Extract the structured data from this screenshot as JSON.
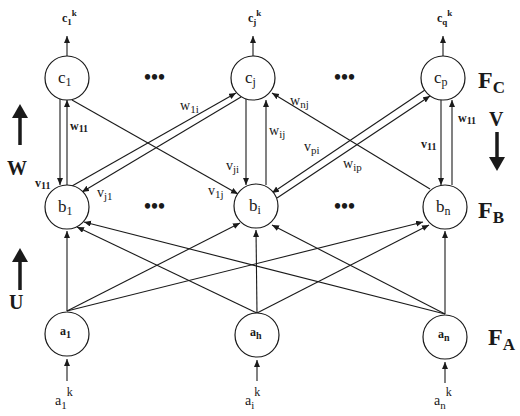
{
  "diagram": {
    "type": "three-layer neural network (FA, FB, FC)",
    "layers": {
      "FC": {
        "label": "F",
        "sub": "C",
        "nodes": [
          {
            "name": "c",
            "sub": "1"
          },
          {
            "name": "c",
            "sub": "j"
          },
          {
            "name": "c",
            "sub": "p"
          }
        ],
        "outputs": [
          {
            "name": "c",
            "sub": "1",
            "sup": "k"
          },
          {
            "name": "c",
            "sub": "j",
            "sup": "k"
          },
          {
            "name": "c",
            "sub": "q",
            "sup": "k"
          }
        ]
      },
      "FB": {
        "label": "F",
        "sub": "B",
        "nodes": [
          {
            "name": "b",
            "sub": "1"
          },
          {
            "name": "b",
            "sub": "i"
          },
          {
            "name": "b",
            "sub": "n"
          }
        ]
      },
      "FA": {
        "label": "F",
        "sub": "A",
        "nodes": [
          {
            "name": "a",
            "sub": "1"
          },
          {
            "name": "a",
            "sub": "h"
          },
          {
            "name": "a",
            "sub": "n"
          }
        ],
        "inputs": [
          {
            "name": "a",
            "sub": "1",
            "sup": "k"
          },
          {
            "name": "a",
            "sub": "i",
            "sup": "k"
          },
          {
            "name": "a",
            "sub": "n",
            "sup": "k"
          }
        ]
      }
    },
    "ellipsis": "•••",
    "matrices": {
      "W": {
        "label": "W",
        "direction": "up"
      },
      "V": {
        "label": "V",
        "direction": "down"
      },
      "U": {
        "label": "U",
        "direction": "up"
      }
    },
    "weights": {
      "w11_left": {
        "name": "w",
        "sub": "11"
      },
      "v11_left": {
        "name": "v",
        "sub": "11"
      },
      "w1i": {
        "name": "w",
        "sub": "1i"
      },
      "vj1": {
        "name": "v",
        "sub": "j1"
      },
      "wij": {
        "name": "w",
        "sub": "ij"
      },
      "vji": {
        "name": "v",
        "sub": "ji"
      },
      "v1j": {
        "name": "v",
        "sub": "1j"
      },
      "wnj": {
        "name": "w",
        "sub": "nj"
      },
      "vpi": {
        "name": "v",
        "sub": "pi"
      },
      "wip": {
        "name": "w",
        "sub": "ip"
      },
      "w11_right": {
        "name": "w",
        "sub": "11"
      },
      "v11_right": {
        "name": "v",
        "sub": "11"
      }
    },
    "colors": {
      "ink": "#1a1a1a",
      "background": "#ffffff"
    }
  }
}
